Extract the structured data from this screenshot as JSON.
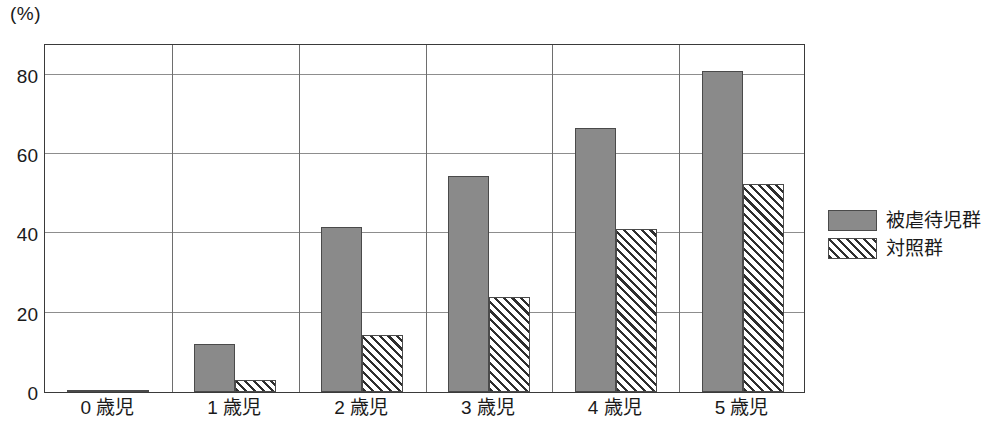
{
  "chart_data": {
    "type": "bar",
    "title": "",
    "subtitle": "",
    "xlabel": "",
    "ylabel": "(%)",
    "unit_label": "(%)",
    "categories": [
      "0 歳児",
      "1 歳児",
      "2 歳児",
      "3 歳児",
      "4 歳児",
      "5 歳児"
    ],
    "series": [
      {
        "name": "被虐待児群",
        "fill": "solid-gray",
        "color": "#8a8a8a",
        "values": [
          0.4,
          12.0,
          41.5,
          54.5,
          66.5,
          81.0
        ]
      },
      {
        "name": "対照群",
        "fill": "diagonal-hatch",
        "color": "#ffffff",
        "values": [
          0.3,
          3.0,
          14.5,
          24.0,
          41.0,
          52.5
        ]
      }
    ],
    "ylim": [
      0,
      88
    ],
    "yticks": [
      0,
      20,
      40,
      60,
      80
    ],
    "ytick_labels": [
      "0",
      "20",
      "40",
      "60",
      "80"
    ],
    "grid": true,
    "grid_axis": "y",
    "legend_position": "right",
    "axis_color": "#3a3a3a",
    "grid_color": "#8d8d8d",
    "background": "#ffffff"
  },
  "legend": {
    "items": [
      {
        "label": "被虐待児群",
        "swatch": "solid-gray-swatch"
      },
      {
        "label": "対照群",
        "swatch": "hatched-swatch"
      }
    ]
  }
}
